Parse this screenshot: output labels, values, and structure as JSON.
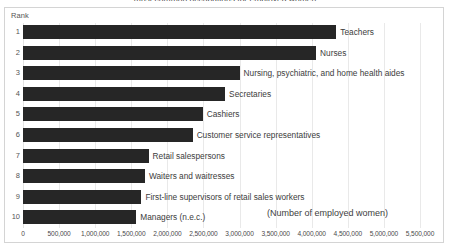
{
  "frame": {
    "clipped_header_text": "most common occupations for employed women",
    "rank_header": "Rank",
    "axis_title": "(Number of employed women)"
  },
  "chart_data": {
    "type": "bar",
    "orientation": "horizontal",
    "title": "",
    "xlabel": "(Number of employed women)",
    "ylabel": "Rank",
    "xlim": [
      0,
      5500000
    ],
    "grid": true,
    "legend": "none",
    "bar_color": "#262626",
    "categories": [
      "Teachers",
      "Nurses",
      "Nursing, psychiatric, and home health aides",
      "Secretaries",
      "Cashiers",
      "Customer service representatives",
      "Retail salespersons",
      "Waiters and waitresses",
      "First-line supervisors of retail sales workers",
      "Managers (n.e.c.)"
    ],
    "ranks": [
      "1",
      "2",
      "3",
      "4",
      "5",
      "6",
      "7",
      "8",
      "9",
      "10"
    ],
    "values": [
      4340000,
      4060000,
      3000000,
      2800000,
      2490000,
      2350000,
      1740000,
      1690000,
      1640000,
      1570000
    ],
    "tick_labels": [
      "0",
      "500,000",
      "1,000,000",
      "1,500,000",
      "2,000,000",
      "2,500,000",
      "3,000,000",
      "3,500,000",
      "4,000,000",
      "4,500,000",
      "5,000,000",
      "5,500,000"
    ],
    "tick_values": [
      0,
      500000,
      1000000,
      1500000,
      2000000,
      2500000,
      3000000,
      3500000,
      4000000,
      4500000,
      5000000,
      5500000
    ]
  }
}
